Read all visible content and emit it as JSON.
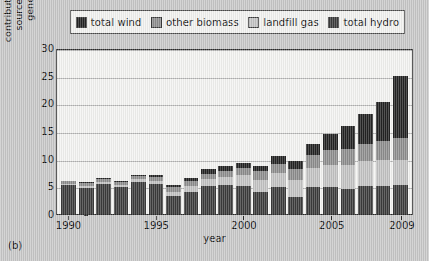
{
  "legend": {
    "items": [
      {
        "label": "total wind",
        "color": "#232323",
        "key": "wind"
      },
      {
        "label": "other biomass",
        "color": "#8e8e8e",
        "key": "biomass"
      },
      {
        "label": "landfill gas",
        "color": "#c4c4c4",
        "key": "landfill"
      },
      {
        "label": "total hydro",
        "color": "#3c3c3c",
        "key": "hydro"
      }
    ]
  },
  "axes": {
    "y_label": "contribution of renewable\nsources to electricity\ngenerated / TWh",
    "x_label": "year",
    "y_ticks": [
      "0",
      "5",
      "10",
      "15",
      "20",
      "25",
      "30"
    ],
    "x_ticks": [
      "1990",
      "1995",
      "2000",
      "2005",
      "2009"
    ]
  },
  "panel_label": "(b)",
  "chart_data": {
    "type": "bar",
    "stacked": true,
    "title": "",
    "xlabel": "year",
    "ylabel": "contribution of renewable sources to electricity generated / TWh",
    "ylim": [
      0,
      30
    ],
    "yticks": [
      0,
      5,
      10,
      15,
      20,
      25,
      30
    ],
    "grid": true,
    "legend_position": "top",
    "categories": [
      "1990",
      "1991",
      "1992",
      "1993",
      "1994",
      "1995",
      "1996",
      "1997",
      "1998",
      "1999",
      "2000",
      "2001",
      "2002",
      "2003",
      "2004",
      "2005",
      "2006",
      "2007",
      "2008",
      "2009"
    ],
    "xtick_labels": [
      "1990",
      "1995",
      "2000",
      "2005",
      "2009"
    ],
    "series": [
      {
        "name": "total hydro",
        "color": "#3c3c3c",
        "values": [
          5.2,
          4.7,
          5.4,
          4.8,
          5.8,
          5.4,
          3.2,
          4.0,
          5.1,
          5.2,
          5.1,
          4.0,
          4.8,
          3.1,
          4.8,
          4.9,
          4.6,
          5.0,
          5.1,
          5.3
        ]
      },
      {
        "name": "landfill gas",
        "color": "#c4c4c4",
        "values": [
          0.2,
          0.3,
          0.4,
          0.4,
          0.5,
          0.6,
          0.8,
          1.0,
          1.2,
          1.5,
          1.9,
          2.2,
          2.6,
          3.1,
          3.6,
          4.0,
          4.3,
          4.5,
          4.6,
          4.5
        ]
      },
      {
        "name": "other biomass",
        "color": "#8e8e8e",
        "values": [
          0.5,
          0.6,
          0.6,
          0.6,
          0.6,
          0.7,
          0.8,
          0.9,
          1.0,
          1.1,
          1.3,
          1.5,
          1.7,
          2.0,
          2.3,
          2.6,
          2.9,
          3.2,
          3.5,
          3.9
        ]
      },
      {
        "name": "total wind",
        "color": "#232323",
        "values": [
          0.1,
          0.1,
          0.1,
          0.2,
          0.2,
          0.4,
          0.5,
          0.7,
          0.9,
          0.9,
          0.9,
          1.0,
          1.3,
          1.4,
          1.9,
          2.9,
          4.2,
          5.3,
          7.1,
          11.3
        ]
      }
    ],
    "totals": [
      6.0,
      5.7,
      6.5,
      6.0,
      7.1,
      7.1,
      5.3,
      6.6,
      8.2,
      8.7,
      9.2,
      8.7,
      10.4,
      9.6,
      12.6,
      14.4,
      16.0,
      18.0,
      20.3,
      25.0
    ]
  }
}
